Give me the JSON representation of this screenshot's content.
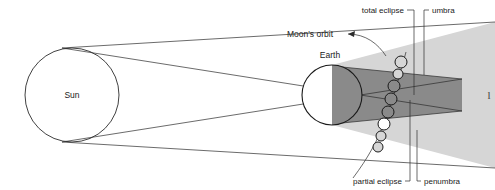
{
  "figure": {
    "kind": "lunar-eclipse-geometry-diagram",
    "background_color": "#ffffff",
    "line_color": "#2b2b2b",
    "text_color": "#1a1a1a"
  },
  "bodies": {
    "sun": {
      "label": "Sun",
      "cx": 72,
      "cy": 95,
      "r": 47,
      "fill": "#ffffff",
      "stroke": "#2b2b2b"
    },
    "earth": {
      "label": "Earth",
      "cx": 332,
      "cy": 95,
      "r": 30,
      "day_fill": "#ffffff",
      "night_fill": "#8a8a8a",
      "stroke": "#1a1a1a"
    }
  },
  "shadow": {
    "umbra": {
      "label": "umbra",
      "fill": "#8a8a8a"
    },
    "penumbra": {
      "label": "penumbra",
      "fill": "#d6d6d6"
    }
  },
  "orbit": {
    "label": "Moon's orbit",
    "moon_fill": "none",
    "moon_stroke": "#1a1a1a",
    "moon_count": 8
  },
  "labels": {
    "total_eclipse": "total eclipse",
    "umbra": "umbra",
    "partial_eclipse": "partial eclipse",
    "penumbra": "penumbra",
    "moons_orbit": "Moon's orbit",
    "sun": "Sun",
    "earth": "Earth",
    "right_edge_fragment": "l"
  }
}
